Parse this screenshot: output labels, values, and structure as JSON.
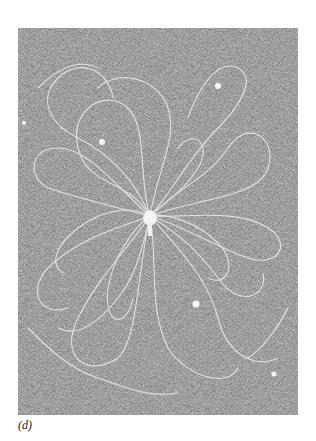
{
  "figure": {
    "label": "(d)",
    "colors": {
      "background": "#8a8a8a",
      "strands": "#e6e6e6",
      "core": "#f4f4f4"
    }
  }
}
